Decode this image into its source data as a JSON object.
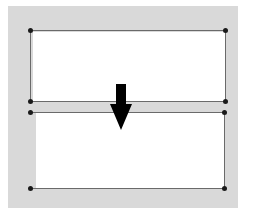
{
  "diagram": {
    "background_color": "#d9d9d9",
    "line_color": "#6a6a6a",
    "vertex_color": "#1a1a1a",
    "arrow_color": "#000000",
    "shapes": [
      {
        "name": "top-rectangle",
        "corners": [
          [
            30,
            30
          ],
          [
            225,
            30
          ],
          [
            225,
            101
          ],
          [
            30,
            101
          ]
        ]
      },
      {
        "name": "bottom-rectangle",
        "corners": [
          [
            30,
            112
          ],
          [
            224,
            112
          ],
          [
            224,
            188
          ],
          [
            30,
            188
          ]
        ]
      }
    ],
    "arrow": {
      "direction": "down",
      "icon": "arrow-down-icon"
    }
  }
}
